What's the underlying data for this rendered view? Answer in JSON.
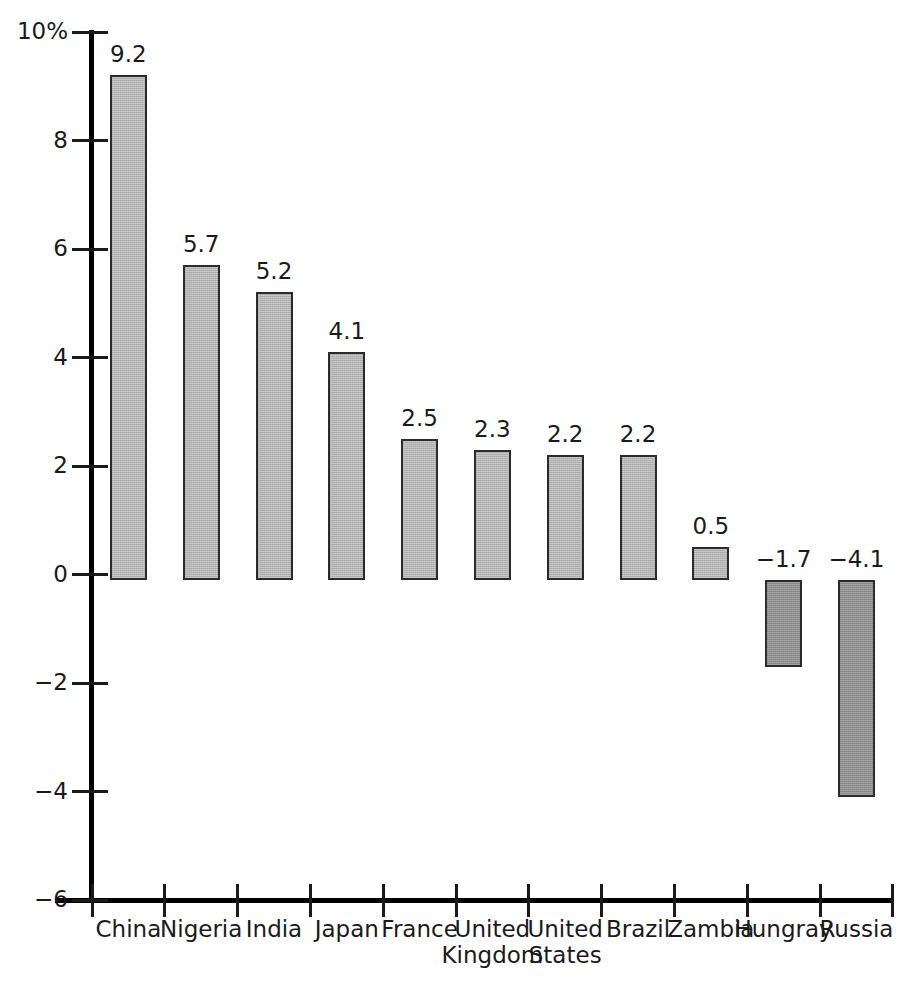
{
  "chart_data": {
    "type": "bar",
    "title": "",
    "subtitle": "",
    "xlabel": "",
    "ylabel": "",
    "ylim": [
      -6,
      10
    ],
    "y_ticks": [
      -6,
      -4,
      -2,
      0,
      2,
      4,
      6,
      8,
      10
    ],
    "y_tick_labels": [
      "−6",
      "−4",
      "−2",
      "0",
      "2",
      "4",
      "6",
      "8",
      "10%"
    ],
    "grid": false,
    "legend": false,
    "unit": "%",
    "categories": [
      "China",
      "Nigeria",
      "India",
      "Japan",
      "France",
      "United Kingdom",
      "United States",
      "Brazil",
      "Zambia",
      "Hungray",
      "Russia"
    ],
    "category_lines": [
      [
        "China",
        ""
      ],
      [
        "Nigeria",
        ""
      ],
      [
        "India",
        ""
      ],
      [
        "Japan",
        ""
      ],
      [
        "France",
        ""
      ],
      [
        "United",
        "Kingdom"
      ],
      [
        "United",
        "States"
      ],
      [
        "Brazil",
        ""
      ],
      [
        "Zambia",
        ""
      ],
      [
        "Hungray",
        ""
      ],
      [
        "Russia",
        ""
      ]
    ],
    "values": [
      9.2,
      5.7,
      5.2,
      4.1,
      2.5,
      2.3,
      2.2,
      2.2,
      0.5,
      -1.7,
      -4.1
    ],
    "value_labels": [
      "9.2",
      "5.7",
      "5.2",
      "4.1",
      "2.5",
      "2.3",
      "2.2",
      "2.2",
      "0.5",
      "−1.7",
      "−4.1"
    ],
    "colors": {
      "positive_bar_fill": "#b2b2b2",
      "negative_bar_fill": "#8c8c8c",
      "bar_outline": "#2b2b2b",
      "axis": "#000000",
      "text": "#1a1a1a",
      "background": "#ffffff"
    }
  }
}
